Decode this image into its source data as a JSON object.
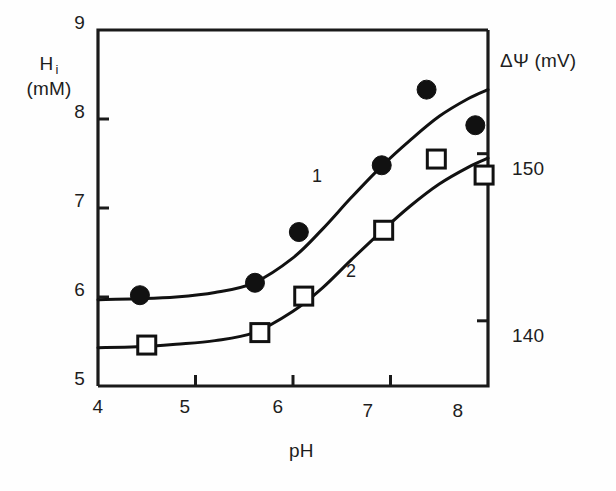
{
  "figure": {
    "background": "#fefefe",
    "ink_color": "#1a1a1a"
  },
  "axes": {
    "left": {
      "symbol": "H",
      "subscript": "i",
      "units": "(mM)",
      "ticks": [
        "9",
        "8",
        "7",
        "6",
        "5"
      ],
      "range": [
        5,
        9
      ]
    },
    "right": {
      "label": "ΔΨ  (mV)",
      "ticks": [
        "150",
        "140"
      ],
      "range": [
        136.1,
        157.4
      ]
    },
    "bottom": {
      "label": "pH",
      "ticks": [
        "4",
        "5",
        "6",
        "7",
        "8"
      ],
      "range": [
        4,
        8
      ]
    }
  },
  "curve_labels": [
    {
      "text": "1",
      "x": 318,
      "y": 177
    },
    {
      "text": "2",
      "x": 352,
      "y": 272
    }
  ],
  "chart_data": {
    "type": "scatter",
    "title": "",
    "xlabel": "pH",
    "ylabel": "H i (mM)",
    "y2label": "ΔΨ (mV)",
    "xlim": [
      4,
      8
    ],
    "ylim": [
      5,
      9
    ],
    "y2lim": [
      136.1,
      157.4
    ],
    "xticks": [
      4,
      5,
      6,
      7,
      8
    ],
    "yticks": [
      5,
      6,
      7,
      8,
      9
    ],
    "y2ticks": [
      140,
      150
    ],
    "grid": false,
    "legend": "inline-curve-numbers",
    "series": [
      {
        "name": "1",
        "marker": "filled-circle",
        "marker_size": 19,
        "color": "#111111",
        "axis": "left",
        "points": [
          {
            "x": 4.43,
            "y": 6.02
          },
          {
            "x": 5.61,
            "y": 6.16
          },
          {
            "x": 6.06,
            "y": 6.73
          },
          {
            "x": 6.91,
            "y": 7.48
          },
          {
            "x": 7.37,
            "y": 8.33
          },
          {
            "x": 7.87,
            "y": 7.93
          }
        ],
        "fit_curve": [
          {
            "x": 4.0,
            "y": 5.97
          },
          {
            "x": 4.4,
            "y": 5.98
          },
          {
            "x": 4.8,
            "y": 6.0
          },
          {
            "x": 5.2,
            "y": 6.05
          },
          {
            "x": 5.6,
            "y": 6.16
          },
          {
            "x": 6.0,
            "y": 6.44
          },
          {
            "x": 6.3,
            "y": 6.76
          },
          {
            "x": 6.6,
            "y": 7.12
          },
          {
            "x": 6.9,
            "y": 7.46
          },
          {
            "x": 7.2,
            "y": 7.76
          },
          {
            "x": 7.5,
            "y": 8.03
          },
          {
            "x": 7.8,
            "y": 8.23
          },
          {
            "x": 8.0,
            "y": 8.33
          }
        ]
      },
      {
        "name": "2",
        "marker": "open-square",
        "marker_size": 18,
        "color": "#111111",
        "axis": "right",
        "points": [
          {
            "x": 4.5,
            "y": 5.46
          },
          {
            "x": 5.66,
            "y": 5.6
          },
          {
            "x": 6.11,
            "y": 6.01
          },
          {
            "x": 6.93,
            "y": 6.75
          },
          {
            "x": 7.47,
            "y": 7.55
          },
          {
            "x": 7.96,
            "y": 7.37
          }
        ],
        "fit_curve": [
          {
            "x": 4.0,
            "y": 5.43
          },
          {
            "x": 4.4,
            "y": 5.44
          },
          {
            "x": 4.8,
            "y": 5.47
          },
          {
            "x": 5.2,
            "y": 5.51
          },
          {
            "x": 5.6,
            "y": 5.6
          },
          {
            "x": 6.0,
            "y": 5.84
          },
          {
            "x": 6.3,
            "y": 6.1
          },
          {
            "x": 6.6,
            "y": 6.42
          },
          {
            "x": 6.9,
            "y": 6.73
          },
          {
            "x": 7.2,
            "y": 7.02
          },
          {
            "x": 7.5,
            "y": 7.27
          },
          {
            "x": 7.8,
            "y": 7.46
          },
          {
            "x": 8.0,
            "y": 7.56
          }
        ]
      }
    ]
  }
}
